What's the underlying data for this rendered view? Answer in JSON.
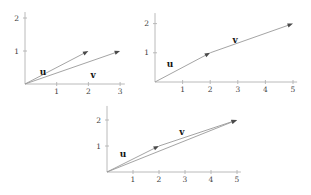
{
  "figure": {
    "background": "#ffffff"
  },
  "style": {
    "axis_color": "#b2b2b2",
    "vector_color": "#9a9a9a",
    "arrowhead_color": "#4a4a4a",
    "tick_label_color": "#3f3f3f",
    "vector_label_color": "#141414"
  },
  "chart_data": [
    {
      "id": "top-left",
      "type": "vector",
      "title": "",
      "x_ticks": [
        1,
        2,
        3
      ],
      "y_ticks": [
        1,
        2
      ],
      "xlim": [
        0,
        3.15
      ],
      "ylim": [
        0,
        2.18
      ],
      "grid": false,
      "vectors": [
        {
          "name": "u",
          "from": [
            0,
            0
          ],
          "to": [
            2,
            1
          ]
        },
        {
          "name": "v",
          "from": [
            0,
            0
          ],
          "to": [
            3,
            1
          ]
        }
      ],
      "point_labels": [
        {
          "text": "u",
          "at": [
            0.57,
            0.36
          ]
        },
        {
          "text": "v",
          "at": [
            2.15,
            0.27
          ]
        }
      ],
      "layout": {
        "origin_px": [
          25,
          84
        ],
        "x_unit_px": 31.7,
        "y_unit_px": 33
      }
    },
    {
      "id": "top-right",
      "type": "vector",
      "title": "",
      "x_ticks": [
        1,
        2,
        3,
        4,
        5
      ],
      "y_ticks": [
        1,
        2
      ],
      "xlim": [
        0,
        5.15
      ],
      "ylim": [
        0,
        2.36
      ],
      "grid": false,
      "vectors": [
        {
          "name": "u",
          "from": [
            0,
            0
          ],
          "to": [
            2,
            1
          ]
        },
        {
          "name": "v",
          "from": [
            2,
            1
          ],
          "to": [
            5,
            2
          ]
        }
      ],
      "point_labels": [
        {
          "text": "u",
          "at": [
            0.54,
            0.62
          ]
        },
        {
          "text": "v",
          "at": [
            2.9,
            1.44
          ]
        }
      ],
      "layout": {
        "origin_px": [
          155,
          82
        ],
        "x_unit_px": 27.6,
        "y_unit_px": 29.2
      }
    },
    {
      "id": "bottom",
      "type": "vector",
      "title": "",
      "x_ticks": [
        1,
        2,
        3,
        4,
        5
      ],
      "y_ticks": [
        1,
        2
      ],
      "xlim": [
        0,
        5.15
      ],
      "ylim": [
        0,
        2.54
      ],
      "grid": false,
      "vectors": [
        {
          "name": "u",
          "from": [
            0,
            0
          ],
          "to": [
            2,
            1
          ]
        },
        {
          "name": "v",
          "from": [
            2,
            1
          ],
          "to": [
            5,
            2
          ]
        },
        {
          "name": "u-plus-v",
          "from": [
            0,
            0
          ],
          "to": [
            5,
            2
          ]
        }
      ],
      "point_labels": [
        {
          "text": "u",
          "at": [
            0.62,
            0.69
          ]
        },
        {
          "text": "v",
          "at": [
            2.88,
            1.54
          ]
        }
      ],
      "layout": {
        "origin_px": [
          107,
          172
        ],
        "x_unit_px": 26,
        "y_unit_px": 26
      }
    }
  ]
}
